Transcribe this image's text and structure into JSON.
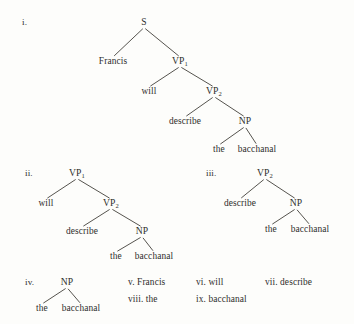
{
  "figure": {
    "background_color": "#fdfdfb",
    "text_color": "#2f2d2c",
    "line_color": "#38352f",
    "sentence": "Francis will describe the bacchanal"
  },
  "items": [
    {
      "id": "item-i",
      "enumerator": "i.",
      "enumerator_x": 22,
      "enumerator_y": 25,
      "type": "tree",
      "root_label": "S",
      "nodes": [
        {
          "name": "node-s",
          "text": "S",
          "sub": "",
          "x": 144,
          "y": 25,
          "kind": "node"
        },
        {
          "name": "node-francis",
          "text": "Francis",
          "sub": "",
          "x": 113,
          "y": 64,
          "kind": "leaf"
        },
        {
          "name": "node-vp1",
          "text": "VP",
          "sub": "1",
          "x": 180,
          "y": 64,
          "kind": "node"
        },
        {
          "name": "node-will",
          "text": "will",
          "sub": "",
          "x": 149,
          "y": 94,
          "kind": "leaf"
        },
        {
          "name": "node-vp2",
          "text": "VP",
          "sub": "2",
          "x": 214,
          "y": 94,
          "kind": "node"
        },
        {
          "name": "node-describe",
          "text": "describe",
          "sub": "",
          "x": 185,
          "y": 124,
          "kind": "leaf"
        },
        {
          "name": "node-np",
          "text": "NP",
          "sub": "",
          "x": 245,
          "y": 124,
          "kind": "node"
        },
        {
          "name": "node-the",
          "text": "the",
          "sub": "",
          "x": 219,
          "y": 152,
          "kind": "leaf"
        },
        {
          "name": "node-bacchanal",
          "text": "bacchanal",
          "sub": "",
          "x": 257,
          "y": 152,
          "kind": "leaf"
        }
      ],
      "edges": [
        {
          "from": "node-s",
          "to": "node-francis"
        },
        {
          "from": "node-s",
          "to": "node-vp1"
        },
        {
          "from": "node-vp1",
          "to": "node-will"
        },
        {
          "from": "node-vp1",
          "to": "node-vp2"
        },
        {
          "from": "node-vp2",
          "to": "node-describe"
        },
        {
          "from": "node-vp2",
          "to": "node-np"
        },
        {
          "from": "node-np",
          "to": "node-the"
        },
        {
          "from": "node-np",
          "to": "node-bacchanal"
        }
      ]
    },
    {
      "id": "item-ii",
      "enumerator": "ii.",
      "enumerator_x": 25,
      "enumerator_y": 176,
      "type": "tree",
      "root_label": "VP1",
      "nodes": [
        {
          "name": "node-vp1",
          "text": "VP",
          "sub": "1",
          "x": 77,
          "y": 176,
          "kind": "node"
        },
        {
          "name": "node-will",
          "text": "will",
          "sub": "",
          "x": 46,
          "y": 206,
          "kind": "leaf"
        },
        {
          "name": "node-vp2",
          "text": "VP",
          "sub": "2",
          "x": 111,
          "y": 206,
          "kind": "node"
        },
        {
          "name": "node-describe",
          "text": "describe",
          "sub": "",
          "x": 82,
          "y": 234,
          "kind": "leaf"
        },
        {
          "name": "node-np",
          "text": "NP",
          "sub": "",
          "x": 142,
          "y": 234,
          "kind": "node"
        },
        {
          "name": "node-the",
          "text": "the",
          "sub": "",
          "x": 116,
          "y": 259,
          "kind": "leaf"
        },
        {
          "name": "node-bacchanal",
          "text": "bacchanal",
          "sub": "",
          "x": 154,
          "y": 259,
          "kind": "leaf"
        }
      ],
      "edges": [
        {
          "from": "node-vp1",
          "to": "node-will"
        },
        {
          "from": "node-vp1",
          "to": "node-vp2"
        },
        {
          "from": "node-vp2",
          "to": "node-describe"
        },
        {
          "from": "node-vp2",
          "to": "node-np"
        },
        {
          "from": "node-np",
          "to": "node-the"
        },
        {
          "from": "node-np",
          "to": "node-bacchanal"
        }
      ]
    },
    {
      "id": "item-iii",
      "enumerator": "iii.",
      "enumerator_x": 206,
      "enumerator_y": 176,
      "type": "tree",
      "root_label": "VP2",
      "nodes": [
        {
          "name": "node-vp2",
          "text": "VP",
          "sub": "2",
          "x": 265,
          "y": 176,
          "kind": "node"
        },
        {
          "name": "node-describe",
          "text": "describe",
          "sub": "",
          "x": 240,
          "y": 206,
          "kind": "leaf"
        },
        {
          "name": "node-np",
          "text": "NP",
          "sub": "",
          "x": 296,
          "y": 206,
          "kind": "node"
        },
        {
          "name": "node-the",
          "text": "the",
          "sub": "",
          "x": 271,
          "y": 232,
          "kind": "leaf"
        },
        {
          "name": "node-bacchanal",
          "text": "bacchanal",
          "sub": "",
          "x": 310,
          "y": 232,
          "kind": "leaf"
        }
      ],
      "edges": [
        {
          "from": "node-vp2",
          "to": "node-describe"
        },
        {
          "from": "node-vp2",
          "to": "node-np"
        },
        {
          "from": "node-np",
          "to": "node-the"
        },
        {
          "from": "node-np",
          "to": "node-bacchanal"
        }
      ]
    },
    {
      "id": "item-iv",
      "enumerator": "iv.",
      "enumerator_x": 25,
      "enumerator_y": 285,
      "type": "tree",
      "root_label": "NP",
      "nodes": [
        {
          "name": "node-np",
          "text": "NP",
          "sub": "",
          "x": 67,
          "y": 285,
          "kind": "node"
        },
        {
          "name": "node-the",
          "text": "the",
          "sub": "",
          "x": 42,
          "y": 311,
          "kind": "leaf"
        },
        {
          "name": "node-bacchanal",
          "text": "bacchanal",
          "sub": "",
          "x": 81,
          "y": 311,
          "kind": "leaf"
        }
      ],
      "edges": [
        {
          "from": "node-np",
          "to": "node-the"
        },
        {
          "from": "node-np",
          "to": "node-bacchanal"
        }
      ]
    },
    {
      "id": "item-v",
      "enumerator": "v.",
      "type": "word",
      "label": "v. Francis",
      "x": 128,
      "y": 285
    },
    {
      "id": "item-vi",
      "enumerator": "vi.",
      "type": "word",
      "label": "vi. will",
      "x": 196,
      "y": 285
    },
    {
      "id": "item-vii",
      "enumerator": "vii.",
      "type": "word",
      "label": "vii. describe",
      "x": 265,
      "y": 285
    },
    {
      "id": "item-viii",
      "enumerator": "viii.",
      "type": "word",
      "label": "viii. the",
      "x": 128,
      "y": 302
    },
    {
      "id": "item-ix",
      "enumerator": "ix.",
      "type": "word",
      "label": "ix. bacchanal",
      "x": 196,
      "y": 302
    }
  ]
}
